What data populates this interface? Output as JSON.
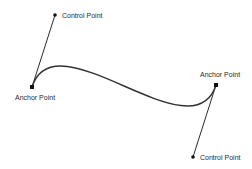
{
  "diagram": {
    "colors": {
      "curve": "#333333",
      "handle": "#2a2a2a",
      "point": "#111111",
      "text": "#2a2a2a"
    },
    "curve": {
      "path": "M32,87 C55,15 193,157 216,85"
    },
    "points": [
      {
        "id": "control-point-1",
        "type": "control",
        "x": 55,
        "y": 15,
        "label": "Control Point"
      },
      {
        "id": "anchor-point-1",
        "type": "anchor",
        "x": 32,
        "y": 87,
        "label": "Anchor Point"
      },
      {
        "id": "anchor-point-2",
        "type": "anchor",
        "x": 216,
        "y": 85,
        "label": "Anchor Point"
      },
      {
        "id": "control-point-2",
        "type": "control",
        "x": 193,
        "y": 157,
        "label": "Control Point"
      }
    ]
  }
}
